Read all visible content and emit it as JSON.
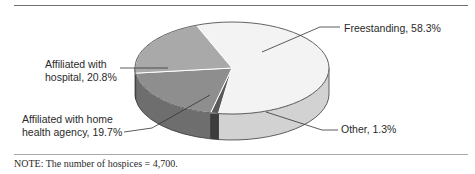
{
  "chart_data": {
    "type": "pie",
    "title": "",
    "style": "3d-pie",
    "slices": [
      {
        "label": "Freestanding",
        "value": 58.3,
        "display": "Freestanding, 58.3%",
        "color": "#f3f3f3",
        "side_color": "#d2d2d2"
      },
      {
        "label": "Other",
        "value": 1.3,
        "display": "Other, 1.3%",
        "color": "#5a5a5a",
        "side_color": "#3c3c3c"
      },
      {
        "label": "Affiliated with home health agency",
        "value": 19.7,
        "display_lines": [
          "Affiliated with home",
          "health agency, 19.7%"
        ],
        "color": "#8e8e8e",
        "side_color": "#6e6e6e"
      },
      {
        "label": "Affiliated with hospital",
        "value": 20.8,
        "display_lines": [
          "Affiliated with",
          "hospital, 20.8%"
        ],
        "color": "#a9a9a9",
        "side_color": "#8a8a8a"
      }
    ],
    "units": "percent",
    "legend": "none (direct labels)"
  },
  "note": "NOTE: The number of hospices = 4,700."
}
